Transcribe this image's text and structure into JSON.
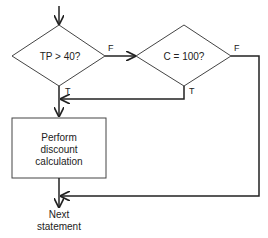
{
  "diagram": {
    "type": "flowchart",
    "decision1": {
      "label": "TP  > 40?",
      "false_label": "F",
      "true_label": "T"
    },
    "decision2": {
      "label": "C = 100?",
      "false_label": "F",
      "true_label": "T"
    },
    "process": {
      "lines": [
        "Perform",
        "discount",
        "calculation"
      ]
    },
    "terminal": {
      "lines": [
        "Next",
        "statement"
      ]
    },
    "colors": {
      "line": "#222222",
      "background": "#ffffff"
    }
  }
}
